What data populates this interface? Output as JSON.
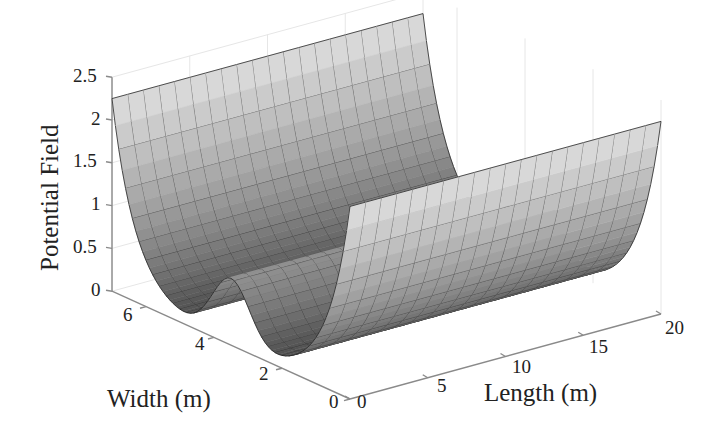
{
  "chart_data": {
    "type": "surface3d",
    "title": "",
    "xlabel": "Length (m)",
    "ylabel": "Width (m)",
    "zlabel": "Potential Field",
    "xlim": [
      0,
      20
    ],
    "ylim": [
      0,
      7
    ],
    "zlim": [
      0,
      2.5
    ],
    "xticks": [
      0,
      5,
      10,
      15,
      20
    ],
    "yticks": [
      0,
      2,
      4,
      6
    ],
    "zticks": [
      0,
      0.5,
      1,
      1.5,
      2,
      2.5
    ],
    "xtick_labels": [
      "0",
      "5",
      "10",
      "15",
      "20"
    ],
    "ytick_labels": [
      "0",
      "2",
      "4",
      "6"
    ],
    "ztick_labels": [
      "0",
      "0.5",
      "1",
      "1.5",
      "2",
      "2.5"
    ],
    "grid": true,
    "colormap": "gray",
    "profile_width_m": [
      0,
      0.5,
      1.0,
      1.75,
      2.5,
      3.0,
      3.5,
      4.0,
      4.5,
      5.25,
      6.0,
      6.5,
      7.0
    ],
    "profile_potential": [
      2.3,
      1.1,
      0.55,
      0.19,
      0.28,
      0.56,
      0.76,
      0.56,
      0.28,
      0.19,
      0.55,
      1.1,
      2.3
    ],
    "model": {
      "wall_amplitude": 2.25,
      "wall_decay": 0.7,
      "bump_amplitude": 0.75,
      "bump_center": 3.5,
      "bump_sigma": 0.55,
      "road_width": 7.0,
      "length_step": 1.0,
      "width_step": 0.1
    },
    "projection": {
      "origin_px": [
        350,
        399
      ],
      "length_unit_px": [
        15.55,
        -4.25
      ],
      "width_unit_px": [
        -34.0,
        -15.4
      ],
      "z_unit_px": 85.6
    },
    "legend": null
  },
  "labels": {
    "z_title": "Potential Field",
    "y_title": "Width (m)",
    "x_title": "Length (m)",
    "z_ticks": [
      "0",
      "0.5",
      "1",
      "1.5",
      "2",
      "2.5"
    ],
    "y_ticks": [
      "0",
      "2",
      "4",
      "6"
    ],
    "x_ticks": [
      "0",
      "5",
      "10",
      "15",
      "20"
    ]
  }
}
